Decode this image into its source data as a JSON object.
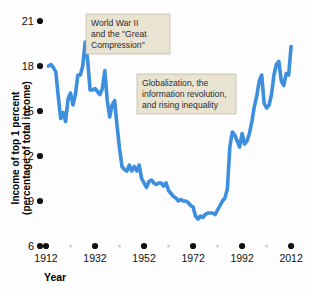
{
  "chart_data": {
    "type": "line",
    "title": "",
    "xlabel": "Year",
    "ylabel": "Income of top 1 percent (percentage of total income)",
    "ylabel_line1": "Income of top 1 percent",
    "ylabel_line2": "(percentage of total income)",
    "xlim": [
      1912,
      2014
    ],
    "ylim": [
      6,
      21
    ],
    "grid": false,
    "legend": "none",
    "line_color": "#3d8fdd",
    "background_color": "#fdfdfd",
    "y_ticks": [
      6,
      9,
      12,
      15,
      18,
      21
    ],
    "y_tick_labels": [
      "6",
      "9",
      "12",
      "15",
      "18",
      "21"
    ],
    "x_ticks": [
      1912,
      1932,
      1952,
      1972,
      1992,
      2012
    ],
    "x_tick_labels": [
      "1912",
      "1932",
      "1952",
      "1972",
      "1992",
      "2012"
    ],
    "x_minor_ticks": [
      1922,
      1942,
      1962,
      1982,
      2002
    ],
    "series": [
      {
        "name": "Income share of top 1 percent",
        "x": [
          1913,
          1914,
          1915,
          1916,
          1917,
          1918,
          1919,
          1920,
          1921,
          1922,
          1923,
          1924,
          1925,
          1926,
          1927,
          1928,
          1929,
          1930,
          1931,
          1932,
          1933,
          1934,
          1935,
          1936,
          1937,
          1938,
          1939,
          1940,
          1941,
          1942,
          1943,
          1944,
          1945,
          1946,
          1947,
          1948,
          1949,
          1950,
          1951,
          1952,
          1953,
          1954,
          1955,
          1956,
          1957,
          1958,
          1959,
          1960,
          1961,
          1962,
          1963,
          1964,
          1965,
          1966,
          1967,
          1968,
          1969,
          1970,
          1971,
          1972,
          1973,
          1974,
          1975,
          1976,
          1977,
          1978,
          1979,
          1980,
          1981,
          1982,
          1983,
          1984,
          1985,
          1986,
          1987,
          1988,
          1989,
          1990,
          1991,
          1992,
          1993,
          1994,
          1995,
          1996,
          1997,
          1998,
          1999,
          2000,
          2001,
          2002,
          2003,
          2004,
          2005,
          2006,
          2007,
          2008,
          2009,
          2010,
          2011,
          2012
        ],
        "values": [
          18.0,
          18.1,
          17.9,
          17.6,
          16.0,
          14.5,
          14.9,
          14.3,
          15.8,
          16.2,
          15.4,
          16.1,
          17.4,
          17.4,
          18.0,
          19.6,
          18.4,
          16.4,
          16.4,
          16.5,
          16.3,
          16.1,
          16.5,
          17.7,
          15.7,
          14.6,
          15.4,
          15.7,
          14.0,
          12.5,
          11.3,
          11.1,
          11.0,
          11.4,
          11.0,
          11.3,
          11.0,
          11.4,
          10.5,
          10.2,
          9.9,
          10.3,
          10.4,
          10.2,
          10.1,
          10.2,
          10.2,
          10.0,
          10.2,
          9.7,
          9.5,
          9.3,
          9.2,
          9.0,
          9.1,
          9.0,
          9.0,
          8.9,
          8.7,
          8.6,
          8.0,
          7.8,
          8.0,
          7.9,
          8.1,
          8.2,
          8.2,
          8.2,
          8.1,
          8.4,
          8.7,
          9.0,
          9.2,
          9.8,
          12.6,
          13.6,
          13.4,
          13.0,
          12.6,
          13.5,
          12.8,
          13.0,
          13.5,
          14.3,
          15.3,
          16.0,
          17.0,
          17.4,
          15.5,
          15.2,
          15.4,
          16.1,
          17.4,
          18.1,
          18.3,
          17.0,
          16.7,
          17.5,
          17.4,
          19.3
        ]
      }
    ],
    "annotations": [
      {
        "id": "ww2-annotation",
        "lines": [
          "World War II",
          "and the \"Great",
          "Compression\""
        ],
        "x_px": 86,
        "y_px": 14,
        "w_px": 84,
        "h_px": 40
      },
      {
        "id": "globalization-annotation",
        "lines": [
          "Globalization, the",
          "information revolution,",
          "and rising inequality"
        ],
        "x_px": 137,
        "y_px": 74,
        "w_px": 99,
        "h_px": 40
      }
    ]
  }
}
